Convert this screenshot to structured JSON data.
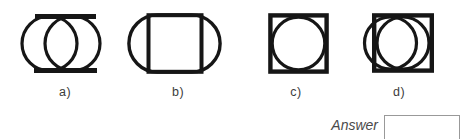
{
  "question": {
    "options": [
      {
        "label": "a)",
        "figure": "two overlapping circles joined by top and bottom tangent lines"
      },
      {
        "label": "b)",
        "figure": "square inscribed in an oval stadium shape"
      },
      {
        "label": "c)",
        "figure": "circle inscribed in a square"
      },
      {
        "label": "d)",
        "figure": "circle inscribed in a square with a second overlapping circle extending out the left side"
      }
    ],
    "answer_label": "Answer",
    "answer_value": ""
  },
  "colors": {
    "background": "#ffffff",
    "ink": "#161616",
    "label_text": "#3c3c3c",
    "answer_text": "#4a4a4a",
    "answer_box_border": "#999999"
  }
}
